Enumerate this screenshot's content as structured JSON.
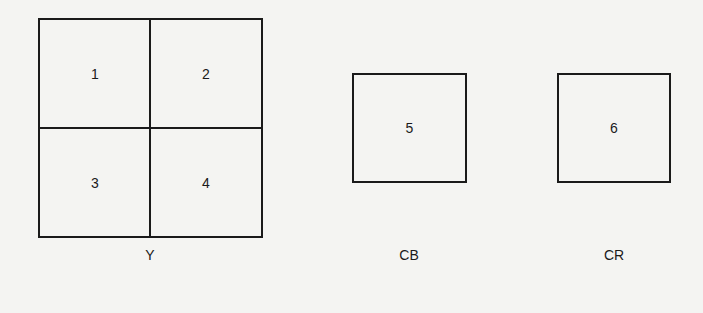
{
  "diagram": {
    "y_block": {
      "label": "Y",
      "cells": [
        "1",
        "2",
        "3",
        "4"
      ]
    },
    "cb_block": {
      "label": "CB",
      "cell": "5"
    },
    "cr_block": {
      "label": "CR",
      "cell": "6"
    }
  }
}
